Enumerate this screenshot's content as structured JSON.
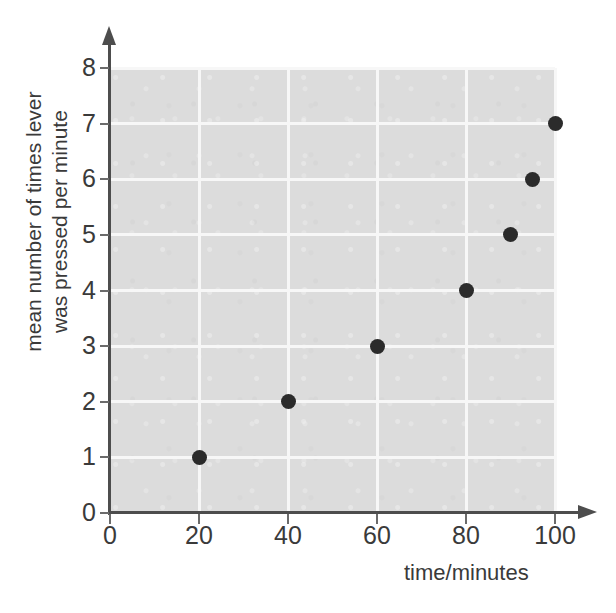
{
  "chart_data": {
    "type": "scatter",
    "title": "",
    "xlabel": "time/minutes",
    "ylabel_line1": "mean number of times lever",
    "ylabel_line2": "was pressed per minute",
    "xlim": [
      0,
      100
    ],
    "ylim": [
      0,
      8
    ],
    "xticks": [
      0,
      20,
      40,
      60,
      80,
      100
    ],
    "yticks": [
      0,
      1,
      2,
      3,
      4,
      5,
      6,
      7,
      8
    ],
    "xtick_labels": [
      "0",
      "20",
      "40",
      "60",
      "80",
      "100"
    ],
    "ytick_labels": [
      "0",
      "1",
      "2",
      "3",
      "4",
      "5",
      "6",
      "7",
      "8"
    ],
    "grid": true,
    "grid_color": "#f7f7f7",
    "plot_background": "#dcdcdc",
    "marker_color": "#2b2b2b",
    "axis_color": "#4d4d4d",
    "legend": null,
    "points": [
      {
        "x": 20,
        "y": 1
      },
      {
        "x": 40,
        "y": 2
      },
      {
        "x": 60,
        "y": 3
      },
      {
        "x": 80,
        "y": 4
      },
      {
        "x": 90,
        "y": 5
      },
      {
        "x": 95,
        "y": 6
      },
      {
        "x": 100,
        "y": 7
      }
    ]
  }
}
